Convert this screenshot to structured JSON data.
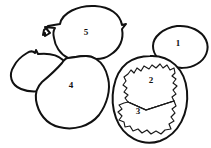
{
  "figure": {
    "background_color": "#ffffff",
    "ink_color": "#111111",
    "style": "hand-drawn black ink line art, white fill",
    "width": 211,
    "height": 148,
    "region_count": 5
  },
  "regions": [
    {
      "id": "region-1",
      "label": "1",
      "shape": "small oval",
      "position": "upper right",
      "label_x": 178,
      "label_y": 44
    },
    {
      "id": "region-2",
      "label": "2",
      "shape": "jagged polygon upper half",
      "position": "inside large right oval, upper",
      "label_x": 151,
      "label_y": 81
    },
    {
      "id": "region-3",
      "label": "3",
      "shape": "jagged polygon lower half",
      "position": "inside large right oval, lower",
      "label_x": 138,
      "label_y": 112
    },
    {
      "id": "region-4",
      "label": "4",
      "shape": "large rounded blob",
      "position": "lower left center",
      "label_x": 71,
      "label_y": 86
    },
    {
      "id": "region-5",
      "label": "5",
      "shape": "large rounded blob with pointed protrusions",
      "position": "top center",
      "label_x": 86,
      "label_y": 33
    }
  ],
  "unlabeled_shapes": [
    {
      "id": "left-tilted-oval",
      "shape": "tilted oval with small top notch",
      "position": "far left middle"
    },
    {
      "id": "large-right-oval",
      "shape": "large vertical oval enclosing regions 2 and 3",
      "position": "lower right"
    }
  ],
  "divider": {
    "id": "region-2-3-divider",
    "description": "straight diagonal line splitting the jagged inner polygon into region 2 above and region 3 below"
  }
}
